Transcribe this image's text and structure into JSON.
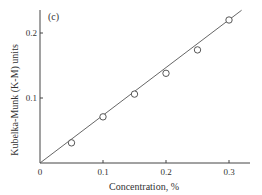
{
  "panel_label": "(c)",
  "chart_data": {
    "type": "scatter",
    "title": "",
    "panel": "(c)",
    "xlabel": "Concentration, %",
    "ylabel": "Kubelka-Munk (K-M) units",
    "xlim": [
      0,
      0.32
    ],
    "ylim": [
      0,
      0.24
    ],
    "xticks": [
      "0",
      "0.1",
      "0.2",
      "0.3"
    ],
    "yticks": [
      "0.1",
      "0.2"
    ],
    "grid": false,
    "legend": null,
    "series": [
      {
        "name": "measured",
        "marker": "open-circle",
        "x": [
          0.05,
          0.1,
          0.15,
          0.2,
          0.25,
          0.3
        ],
        "y": [
          0.031,
          0.071,
          0.106,
          0.138,
          0.174,
          0.22
        ]
      },
      {
        "name": "linear fit",
        "style": "line",
        "x": [
          0,
          0.32
        ],
        "y": [
          0,
          0.235
        ]
      }
    ]
  }
}
